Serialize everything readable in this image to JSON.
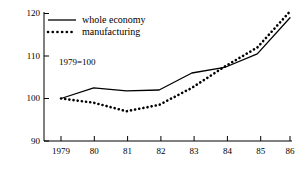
{
  "chart_data": {
    "type": "line",
    "title": "",
    "subtitle": "",
    "xlabel": "",
    "ylabel": "",
    "annotation": "1979=100",
    "x": [
      1979,
      1980,
      1981,
      1982,
      1983,
      1984,
      1985,
      1986
    ],
    "categories": [
      "1979",
      "80",
      "81",
      "82",
      "83",
      "84",
      "85",
      "86"
    ],
    "series": [
      {
        "name": "whole economy",
        "style": "solid",
        "values": [
          100,
          102.5,
          101.8,
          102,
          106,
          107.3,
          110.5,
          119
        ]
      },
      {
        "name": "manufacturing",
        "style": "dotted",
        "values": [
          100,
          99,
          97,
          98.5,
          102.5,
          107.5,
          112,
          120.5
        ]
      }
    ],
    "ylim": [
      90,
      120
    ],
    "yticks": [
      90,
      100,
      110,
      120
    ],
    "ytick_labels": [
      "90",
      "100",
      "110",
      "120"
    ],
    "xlim": [
      1979,
      1986
    ],
    "grid": false,
    "legend_position": "top-left"
  },
  "legend": {
    "items": [
      {
        "label": "whole economy",
        "marker": "solid-line-marker"
      },
      {
        "label": "manufacturing",
        "marker": "dotted-line-marker"
      }
    ]
  },
  "axes": {
    "y_ticks": [
      "120",
      "110",
      "100",
      "90"
    ],
    "x_ticks": [
      "1979",
      "80",
      "81",
      "82",
      "83",
      "84",
      "85",
      "86"
    ]
  },
  "colors": {
    "ink": "#000000",
    "background": "#ffffff"
  }
}
